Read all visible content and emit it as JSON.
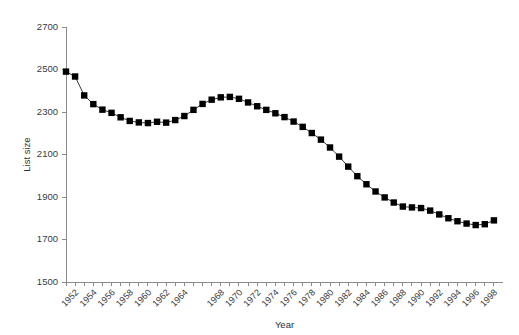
{
  "chart_data": {
    "type": "line",
    "title": "",
    "subtitle": "",
    "xlabel": "Year",
    "ylabel": "List size",
    "xlim": [
      1951,
      1999
    ],
    "ylim": [
      1500,
      2700
    ],
    "yticks": [
      1500,
      1700,
      1900,
      2100,
      2300,
      2500,
      2700
    ],
    "xticks": [
      1951,
      1952,
      1953,
      1954,
      1955,
      1956,
      1957,
      1958,
      1959,
      1960,
      1961,
      1962,
      1963,
      1964,
      1965,
      1966,
      1967,
      1968,
      1969,
      1970,
      1971,
      1972,
      1973,
      1974,
      1975,
      1976,
      1977,
      1978,
      1979,
      1980,
      1981,
      1982,
      1983,
      1984,
      1985,
      1986,
      1987,
      1988,
      1989,
      1990,
      1991,
      1992,
      1993,
      1994,
      1995,
      1996,
      1997,
      1998
    ],
    "xtick_labels": [
      "",
      "1952",
      "",
      "1954",
      "",
      "1956",
      "",
      "1958",
      "",
      "1960",
      "",
      "1962",
      "",
      "1964",
      "",
      "",
      "",
      "1968",
      "",
      "1970",
      "",
      "1972",
      "",
      "1974",
      "",
      "1976",
      "",
      "1978",
      "",
      "1980",
      "",
      "1982",
      "",
      "1984",
      "",
      "1986",
      "",
      "1988",
      "",
      "1990",
      "",
      "1992",
      "",
      "1994",
      "",
      "1996",
      "",
      "1998"
    ],
    "grid": false,
    "legend": false,
    "legend_position": "none",
    "marker": "square",
    "marker_color": "#000000",
    "line_color": "#222222",
    "x": [
      1951,
      1952,
      1953,
      1954,
      1955,
      1956,
      1957,
      1958,
      1959,
      1960,
      1961,
      1962,
      1963,
      1964,
      1965,
      1966,
      1967,
      1968,
      1969,
      1970,
      1971,
      1972,
      1973,
      1974,
      1975,
      1976,
      1977,
      1978,
      1979,
      1980,
      1981,
      1982,
      1983,
      1984,
      1985,
      1986,
      1987,
      1988,
      1989,
      1990,
      1991,
      1992,
      1993,
      1994,
      1995,
      1996,
      1997,
      1998
    ],
    "values": [
      2490,
      2467,
      2378,
      2337,
      2311,
      2296,
      2275,
      2258,
      2251,
      2248,
      2254,
      2250,
      2262,
      2281,
      2310,
      2338,
      2358,
      2369,
      2371,
      2362,
      2345,
      2327,
      2310,
      2294,
      2276,
      2255,
      2230,
      2201,
      2170,
      2133,
      2090,
      2043,
      1998,
      1960,
      1926,
      1898,
      1874,
      1855,
      1851,
      1848,
      1836,
      1818,
      1800,
      1786,
      1775,
      1768,
      1772,
      1790
    ],
    "series": [
      {
        "name": "List size",
        "values": [
          2490,
          2467,
          2378,
          2337,
          2311,
          2296,
          2275,
          2258,
          2251,
          2248,
          2254,
          2250,
          2262,
          2281,
          2310,
          2338,
          2358,
          2369,
          2371,
          2362,
          2345,
          2327,
          2310,
          2294,
          2276,
          2255,
          2230,
          2201,
          2170,
          2133,
          2090,
          2043,
          1998,
          1960,
          1926,
          1898,
          1874,
          1855,
          1851,
          1848,
          1836,
          1818,
          1800,
          1786,
          1775,
          1768,
          1772,
          1790
        ]
      }
    ]
  }
}
